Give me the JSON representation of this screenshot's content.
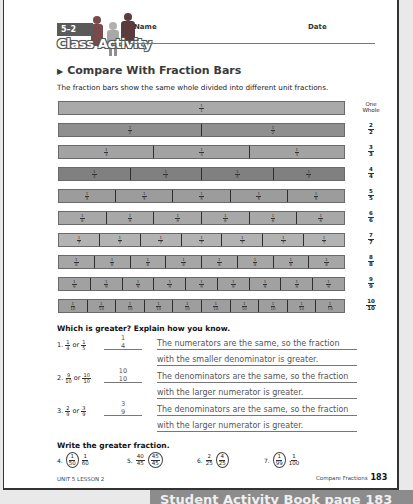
{
  "header": {
    "lesson_number": "5–2",
    "activity_label": "Class Activity",
    "name_label": "Name",
    "date_label": "Date"
  },
  "section": {
    "title": "Compare With Fraction Bars",
    "intro": "The fraction bars show the same whole divided into different unit fractions."
  },
  "fraction_bars": [
    {
      "parts": 1,
      "unit": "1/1",
      "label_top": "One",
      "label_bottom": "Whole",
      "color": "#a9a9a9"
    },
    {
      "parts": 2,
      "unit": "1/2",
      "label_top": "2",
      "label_bottom": "2",
      "color": "#8f8f8f"
    },
    {
      "parts": 3,
      "unit": "1/3",
      "label_top": "3",
      "label_bottom": "3",
      "color": "#a3a3a3"
    },
    {
      "parts": 4,
      "unit": "1/4",
      "label_top": "4",
      "label_bottom": "4",
      "color": "#808080"
    },
    {
      "parts": 5,
      "unit": "1/5",
      "label_top": "5",
      "label_bottom": "5",
      "color": "#9c9c9c"
    },
    {
      "parts": 6,
      "unit": "1/6",
      "label_top": "6",
      "label_bottom": "6",
      "color": "#a8a8a8"
    },
    {
      "parts": 7,
      "unit": "1/7",
      "label_top": "7",
      "label_bottom": "7",
      "color": "#b3b3b3"
    },
    {
      "parts": 8,
      "unit": "1/8",
      "label_top": "8",
      "label_bottom": "8",
      "color": "#a6a6a6"
    },
    {
      "parts": 9,
      "unit": "1/9",
      "label_top": "9",
      "label_bottom": "9",
      "color": "#a1a1a1"
    },
    {
      "parts": 10,
      "unit": "1/10",
      "label_top": "10",
      "label_bottom": "10",
      "color": "#9e9e9e"
    }
  ],
  "which_greater": {
    "heading": "Which is greater? Explain how you know.",
    "questions": [
      {
        "number": "1.",
        "a": {
          "n": "1",
          "d": "4"
        },
        "or": "or",
        "b": {
          "n": "1",
          "d": "5"
        },
        "answer": {
          "n": "1",
          "d": "4"
        },
        "explanation_line1": "The numerators are the same, so the fraction",
        "explanation_line2": "with the smaller denominator is greater."
      },
      {
        "number": "2.",
        "a": {
          "n": "9",
          "d": "10"
        },
        "or": "or",
        "b": {
          "n": "10",
          "d": "10"
        },
        "answer": {
          "n": "10",
          "d": "10"
        },
        "explanation_line1": "The denominators are the same, so the fraction",
        "explanation_line2": "with the larger numerator is greater."
      },
      {
        "number": "3.",
        "a": {
          "n": "2",
          "d": "9"
        },
        "or": "or",
        "b": {
          "n": "3",
          "d": "9"
        },
        "answer": {
          "n": "3",
          "d": "9"
        },
        "explanation_line1": "The denominators are the same, so the fraction",
        "explanation_line2": "with the larger numerator is greater."
      }
    ]
  },
  "write_greater": {
    "heading": "Write the greater fraction.",
    "items": [
      {
        "number": "4.",
        "a": {
          "n": "1",
          "d": "50",
          "circled": true
        },
        "b": {
          "n": "1",
          "d": "60",
          "circled": false
        }
      },
      {
        "number": "5.",
        "a": {
          "n": "40",
          "d": "45",
          "circled": false
        },
        "b": {
          "n": "45",
          "d": "45",
          "circled": true
        }
      },
      {
        "number": "6.",
        "a": {
          "n": "2",
          "d": "25",
          "circled": false
        },
        "b": {
          "n": "4",
          "d": "25",
          "circled": true
        }
      },
      {
        "number": "7.",
        "a": {
          "n": "1",
          "d": "99",
          "circled": true
        },
        "b": {
          "n": "1",
          "d": "100",
          "circled": false
        }
      }
    ]
  },
  "footer": {
    "unit_lesson": "UNIT 5 LESSON 2",
    "topic": "Compare Fractions",
    "page_number": "183"
  },
  "below_strip_text": "Student Activity Book   page 183"
}
